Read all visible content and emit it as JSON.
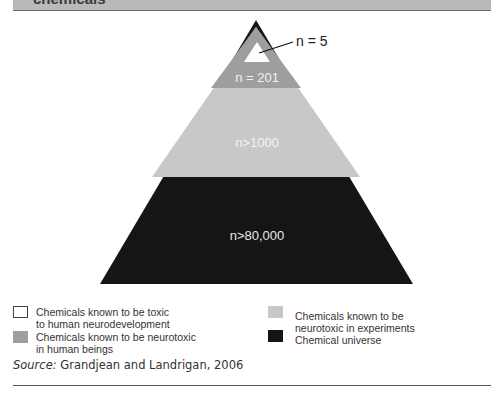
{
  "header": {
    "title": "chemicals"
  },
  "pyramid": {
    "levels": [
      {
        "label": "n = 5",
        "description": "Chemicals known to be toxic to human neurodevelopment",
        "color": "#ffffff"
      },
      {
        "label": "n = 201",
        "description": "Chemicals known to be neurotoxic in human beings",
        "color": "#9e9e9e"
      },
      {
        "label": "n>1000",
        "description": "Chemicals known to be neurotoxic in experiments",
        "color": "#c8c8c8"
      },
      {
        "label": "n>80,000",
        "description": "Chemical universe",
        "color": "#151515"
      }
    ]
  },
  "legend": {
    "items": [
      {
        "line1": "Chemicals known to be toxic",
        "line2": "to human neurodevelopment",
        "color": "#ffffff"
      },
      {
        "line1": "Chemicals known to be neurotoxic",
        "line2": "in human beings",
        "color": "#9e9e9e"
      },
      {
        "line1": "Chemicals known to be",
        "line2": "neurotoxic in experiments",
        "color": "#c8c8c8"
      },
      {
        "line1": "Chemical universe",
        "line2": "",
        "color": "#151515"
      }
    ]
  },
  "source": {
    "prefix": "Source:",
    "text": " Grandjean and Landrigan, 2006"
  }
}
